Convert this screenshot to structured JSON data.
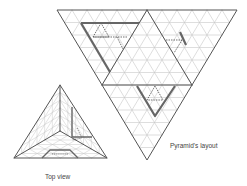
{
  "labels": {
    "top_view": "Top view",
    "layout": "Pyramid's layout"
  },
  "colors": {
    "background": "#ffffff",
    "grid": "#c8c8c8",
    "edge": "#555555",
    "highlight": "#666666",
    "dashed": "#333333",
    "text": "#444444"
  },
  "layout_net": {
    "outer": [
      [
        57,
        10
      ],
      [
        237,
        10
      ],
      [
        147,
        160
      ]
    ],
    "inner_edges": [
      [
        [
          147,
          10
        ],
        [
          102,
          85
        ]
      ],
      [
        [
          147,
          10
        ],
        [
          192,
          85
        ]
      ],
      [
        [
          102,
          85
        ],
        [
          192,
          85
        ]
      ]
    ],
    "grid_divisions": 12,
    "thick_paths": [
      [
        [
          81,
          23
        ],
        [
          139,
          23
        ]
      ],
      [
        [
          81,
          23
        ],
        [
          110,
          72
        ]
      ],
      [
        [
          180,
          32
        ],
        [
          186,
          45
        ]
      ],
      [
        [
          137,
          86
        ],
        [
          155,
          116
        ],
        [
          175,
          86
        ]
      ]
    ],
    "dashed_paths": [
      [
        [
          101,
          23
        ],
        [
          93,
          37
        ],
        [
          109,
          37
        ],
        [
          101,
          23
        ]
      ],
      [
        [
          93,
          37
        ],
        [
          128,
          37
        ]
      ],
      [
        [
          117,
          37
        ],
        [
          123,
          49
        ]
      ],
      [
        [
          166,
          40
        ],
        [
          182,
          40
        ]
      ],
      [
        [
          182,
          40
        ],
        [
          174,
          53
        ]
      ],
      [
        [
          155,
          86
        ],
        [
          147,
          100
        ],
        [
          163,
          100
        ],
        [
          155,
          86
        ]
      ]
    ]
  },
  "top_view": {
    "outer": [
      [
        60,
        85
      ],
      [
        14,
        158
      ],
      [
        107,
        158
      ]
    ],
    "center": [
      60,
      131
    ],
    "grid_divisions": 6,
    "thick_paths": [
      [
        [
          72,
          107
        ],
        [
          72,
          137
        ],
        [
          92,
          137
        ]
      ],
      [
        [
          42,
          158
        ],
        [
          50,
          150
        ],
        [
          70,
          150
        ],
        [
          78,
          158
        ]
      ]
    ],
    "dashed_paths": [
      [
        [
          77,
          128
        ],
        [
          82,
          138
        ],
        [
          72,
          140
        ]
      ],
      [
        [
          52,
          154
        ],
        [
          68,
          154
        ]
      ]
    ]
  }
}
